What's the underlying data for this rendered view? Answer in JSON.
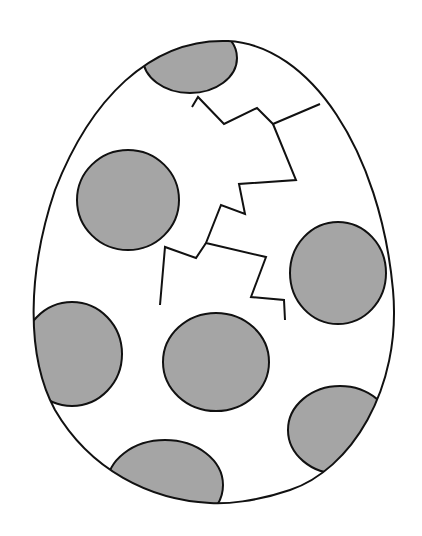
{
  "illustration": {
    "subject": "cracked spotted egg",
    "style": "black line art with gray spots",
    "colors": {
      "background": "#ffffff",
      "outline": "#111111",
      "spot_fill": "#a5a5a5"
    },
    "spot_count": 8,
    "crack_count": 1
  }
}
